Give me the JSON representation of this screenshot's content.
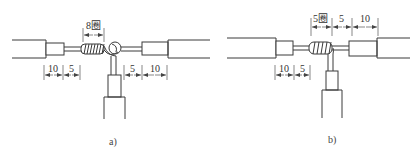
{
  "figure": {
    "panels": [
      {
        "id": "a",
        "caption": "a)",
        "dimensions": {
          "coil_turns": "8圈",
          "left_sleeve": "10",
          "left_bare": "5",
          "right_bare": "5",
          "right_sleeve": "10"
        },
        "description": "T-joint: branch wire knotted around main wire, 8 turns"
      },
      {
        "id": "b",
        "caption": "b)",
        "dimensions": {
          "coil_turns": "5圈",
          "top_bare": "5",
          "top_sleeve": "10",
          "left_sleeve": "10",
          "left_bare": "5"
        },
        "description": "T-joint: branch wire wound around main wire, 5 turns"
      }
    ]
  }
}
